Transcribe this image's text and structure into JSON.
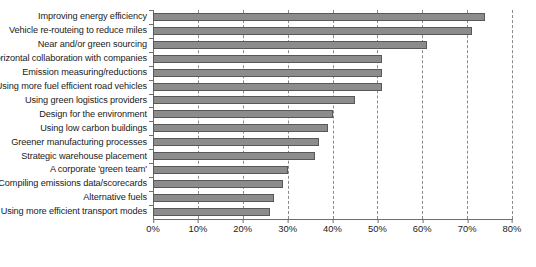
{
  "chart_data": {
    "type": "bar",
    "orientation": "horizontal",
    "title": "",
    "xlabel": "",
    "ylabel": "",
    "xlim": [
      0,
      80
    ],
    "xticks": [
      "0%",
      "10%",
      "20%",
      "30%",
      "40%",
      "50%",
      "60%",
      "70%",
      "80%"
    ],
    "xtick_values": [
      0,
      10,
      20,
      30,
      40,
      50,
      60,
      70,
      80
    ],
    "grid": "vertical-dashed",
    "legend": "none",
    "bar_color": "#8c8c8c",
    "bar_border_color": "#585858",
    "categories": [
      "Improving energy efficiency",
      "Vehicle re-routeing to reduce miles",
      "Near and/or green sourcing",
      "Horizontal collaboration with companies",
      "Emission measuring/reductions",
      "Using more fuel efficient road vehicles",
      "Using green logistics providers",
      "Design for the environment",
      "Using low carbon buildings",
      "Greener manufacturing processes",
      "Strategic warehouse placement",
      "A corporate 'green team'",
      "Compiling emissions data/scorecards",
      "Alternative fuels",
      "Using more efficient transport modes"
    ],
    "values": [
      74,
      71,
      61,
      51,
      51,
      51,
      45,
      40,
      39,
      37,
      36,
      30,
      29,
      27,
      26
    ]
  }
}
